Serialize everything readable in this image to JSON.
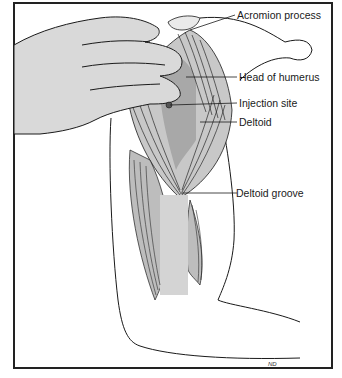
{
  "figure": {
    "labels": [
      {
        "id": "acromion",
        "text": "Acromion process"
      },
      {
        "id": "humerus",
        "text": "Head of humerus"
      },
      {
        "id": "injection",
        "text": "Injection site"
      },
      {
        "id": "deltoid",
        "text": "Deltoid"
      },
      {
        "id": "groove",
        "text": "Deltoid groove"
      }
    ],
    "signature": "ND"
  },
  "colors": {
    "line": "#1a1a1a",
    "shade": "#c8c8c8",
    "skin": "#d9d9d9",
    "background": "#ffffff"
  }
}
